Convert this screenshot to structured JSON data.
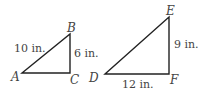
{
  "diagram": {
    "title": "",
    "triangles": [
      {
        "id": "ABC",
        "vertices": {
          "A": {
            "label": "A",
            "x": 22,
            "y": 73
          },
          "B": {
            "label": "B",
            "x": 70,
            "y": 34
          },
          "C": {
            "label": "C",
            "x": 70,
            "y": 73
          }
        },
        "sides": {
          "AB": "10 in.",
          "BC": "6 in."
        }
      },
      {
        "id": "DEF",
        "vertices": {
          "D": {
            "label": "D",
            "x": 105,
            "y": 74
          },
          "E": {
            "label": "E",
            "x": 169,
            "y": 17
          },
          "F": {
            "label": "F",
            "x": 169,
            "y": 74
          }
        },
        "sides": {
          "EF": "9 in.",
          "DF": "12 in."
        }
      }
    ],
    "colors": {
      "stroke": "#222222",
      "label": "#444444",
      "background": "#ffffff"
    }
  }
}
